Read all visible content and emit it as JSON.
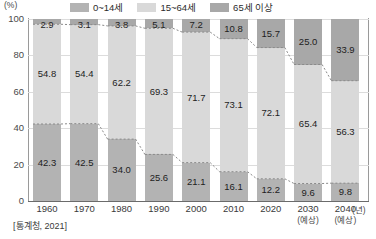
{
  "axis_unit_label": "(%)",
  "source_note": "[통계청, 2021]",
  "x_unit_label": "(년)",
  "legend": {
    "items": [
      {
        "label": "0~14세",
        "color": "#b3b3b3"
      },
      {
        "label": "15~64세",
        "color": "#d9d9d9"
      },
      {
        "label": "65세 이상",
        "color": "#a8a8a8"
      }
    ]
  },
  "chart_data": {
    "type": "bar",
    "stacked": true,
    "title": "",
    "xlabel": "(년)",
    "ylabel": "(%)",
    "ylim": [
      0,
      100
    ],
    "yticks": [
      0,
      20,
      40,
      60,
      80,
      100
    ],
    "grid": true,
    "legend_position": "top",
    "categories": [
      "1960",
      "1970",
      "1980",
      "1990",
      "2000",
      "2010",
      "2020",
      "2030",
      "2040"
    ],
    "category_notes": [
      "",
      "",
      "",
      "",
      "",
      "",
      "",
      "(예상)",
      "(예상)"
    ],
    "series": [
      {
        "name": "0~14세",
        "color": "#b3b3b3",
        "values": [
          42.3,
          42.5,
          34.0,
          25.6,
          21.1,
          16.1,
          12.2,
          9.6,
          9.8
        ]
      },
      {
        "name": "15~64세",
        "color": "#d9d9d9",
        "values": [
          54.8,
          54.4,
          62.2,
          69.3,
          71.7,
          73.1,
          72.1,
          65.4,
          56.3
        ]
      },
      {
        "name": "65세 이상",
        "color": "#a8a8a8",
        "values": [
          2.9,
          3.1,
          3.8,
          5.1,
          7.2,
          10.8,
          15.7,
          25.0,
          33.9
        ]
      }
    ],
    "annotations": [
      "점선은 각 구간 경계를 연결한 추세선"
    ]
  },
  "ylabels": {
    "t0": "0",
    "t20": "20",
    "t40": "40",
    "t60": "60",
    "t80": "80",
    "t100": "100"
  },
  "bars": [
    {
      "year": "1960",
      "note": "",
      "low": "42.3",
      "mid": "54.8",
      "high": "2.9"
    },
    {
      "year": "1970",
      "note": "",
      "low": "42.5",
      "mid": "54.4",
      "high": "3.1"
    },
    {
      "year": "1980",
      "note": "",
      "low": "34.0",
      "mid": "62.2",
      "high": "3.8"
    },
    {
      "year": "1990",
      "note": "",
      "low": "25.6",
      "mid": "69.3",
      "high": "5.1"
    },
    {
      "year": "2000",
      "note": "",
      "low": "21.1",
      "mid": "71.7",
      "high": "7.2"
    },
    {
      "year": "2010",
      "note": "",
      "low": "16.1",
      "mid": "73.1",
      "high": "10.8"
    },
    {
      "year": "2020",
      "note": "",
      "low": "12.2",
      "mid": "72.1",
      "high": "15.7"
    },
    {
      "year": "2030",
      "note": "(예상)",
      "low": "9.6",
      "mid": "65.4",
      "high": "25.0"
    },
    {
      "year": "2040",
      "note": "(예상)",
      "low": "9.8",
      "mid": "56.3",
      "high": "33.9"
    }
  ]
}
